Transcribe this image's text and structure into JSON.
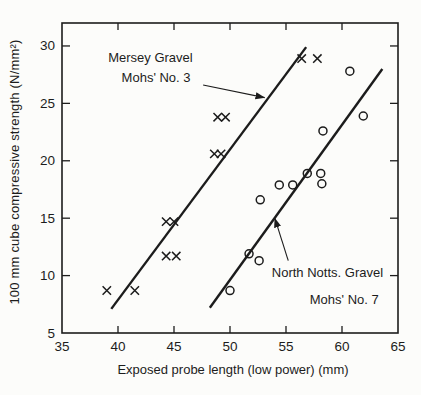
{
  "figure": {
    "ink": "#1c1c1c",
    "background": "#fcfcfa"
  },
  "chart_data": {
    "type": "scatter",
    "title": "",
    "xlabel": "Exposed probe length (low power) (mm)",
    "ylabel": "100 mm cube compressive strength (N/mm²)",
    "xlim": [
      35,
      65
    ],
    "ylim": [
      5,
      32
    ],
    "xticks": [
      35,
      40,
      45,
      50,
      55,
      60,
      65
    ],
    "yticks": [
      5,
      10,
      15,
      20,
      25,
      30
    ],
    "grid": false,
    "frame": "box with inward ticks on all four sides",
    "series": [
      {
        "name": "Mersey Gravel Mohs' No. 3",
        "marker": "x",
        "points": [
          [
            39.0,
            8.7
          ],
          [
            41.5,
            8.7
          ],
          [
            44.3,
            11.7
          ],
          [
            45.2,
            11.7
          ],
          [
            44.3,
            14.7
          ],
          [
            45.0,
            14.7
          ],
          [
            48.6,
            20.6
          ],
          [
            49.2,
            20.6
          ],
          [
            48.9,
            23.8
          ],
          [
            49.6,
            23.8
          ],
          [
            56.4,
            28.9
          ],
          [
            57.8,
            28.9
          ]
        ],
        "fit_line": {
          "from": [
            39.4,
            7.1
          ],
          "to": [
            56.8,
            29.9
          ]
        }
      },
      {
        "name": "North Notts. Gravel Mohs' No. 7",
        "marker": "circle",
        "points": [
          [
            50.0,
            8.7
          ],
          [
            51.7,
            11.9
          ],
          [
            52.6,
            11.3
          ],
          [
            52.7,
            16.6
          ],
          [
            54.4,
            17.9
          ],
          [
            55.6,
            17.9
          ],
          [
            56.9,
            18.9
          ],
          [
            58.1,
            18.9
          ],
          [
            58.2,
            18.0
          ],
          [
            58.3,
            22.6
          ],
          [
            60.7,
            27.8
          ],
          [
            61.9,
            23.9
          ]
        ],
        "fit_line": {
          "from": [
            48.2,
            7.2
          ],
          "to": [
            63.6,
            28.0
          ]
        }
      }
    ],
    "annotations": [
      {
        "id": "mersey",
        "lines": [
          {
            "text": "Mersey Gravel",
            "anchor": [
              42.9,
              29.0
            ]
          },
          {
            "text": "Mohs' No. 3",
            "anchor": [
              43.4,
              27.3
            ]
          }
        ],
        "arrow": {
          "from": [
            47.6,
            26.6
          ],
          "to": [
            53.1,
            25.5
          ]
        }
      },
      {
        "id": "north-notts",
        "lines": [
          {
            "text": "North Notts. Gravel",
            "anchor": [
              58.7,
              10.3
            ]
          },
          {
            "text": "Mohs' No. 7",
            "anchor": [
              60.2,
              8.0
            ]
          }
        ],
        "arrow": {
          "from": [
            55.2,
            11.3
          ],
          "to": [
            54.0,
            15.0
          ]
        }
      }
    ]
  }
}
